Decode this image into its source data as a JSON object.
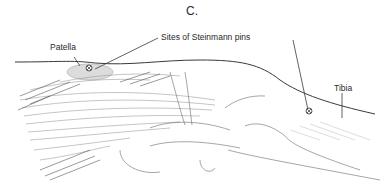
{
  "figure": {
    "panel_label": "C.",
    "labels": {
      "patella": "Patella",
      "pins": "Sites of Steinmann pins",
      "tibia": "Tibia"
    },
    "pin_marker_symbol": "⊗",
    "colors": {
      "line": "#3a3a3a",
      "patella_fill": "#d9d9d9",
      "hatch": "#8a8a8a"
    }
  }
}
